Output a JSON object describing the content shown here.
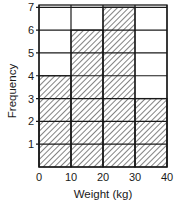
{
  "chart_data": {
    "type": "bar",
    "subtype": "histogram",
    "title": "",
    "xlabel": "Weight (kg)",
    "ylabel": "Frequency",
    "bins": [
      [
        0,
        10
      ],
      [
        10,
        20
      ],
      [
        20,
        30
      ],
      [
        30,
        40
      ]
    ],
    "categories": [
      "0-10",
      "10-20",
      "20-30",
      "30-40"
    ],
    "values": [
      4,
      6,
      7,
      3
    ],
    "x_ticks": [
      "0",
      "10",
      "20",
      "30",
      "40"
    ],
    "y_ticks": [
      "1",
      "2",
      "3",
      "4",
      "5",
      "6",
      "7"
    ],
    "xlim": [
      0,
      40
    ],
    "ylim": [
      0,
      7.1
    ],
    "grid": true,
    "fill": "diagonal-hatch",
    "legend": null
  },
  "colors": {
    "line": "#1a1a1a",
    "background": "#ffffff"
  }
}
